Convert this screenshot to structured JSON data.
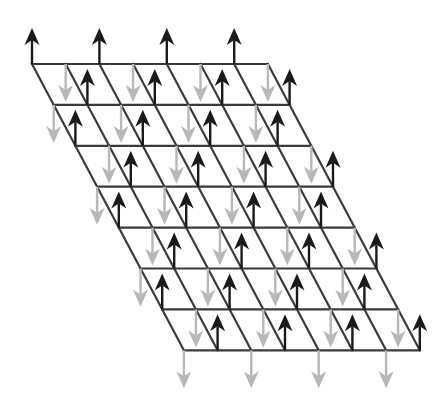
{
  "diagram": {
    "title": "",
    "lattice": {
      "rows": 7,
      "cols": 7,
      "origin": [
        32,
        64
      ],
      "col_step": [
        33.7,
        0
      ],
      "row_step": [
        21.7,
        40.9
      ],
      "line_color": "#3a3a3a"
    },
    "spins": {
      "rule": "node (c, k) with (c + k) even -> up arrow; odd -> down arrow",
      "up": {
        "color": "#1a1a1a",
        "label": "spin-up",
        "length": 36
      },
      "down": {
        "color": "#b8b8b8",
        "label": "spin-down",
        "length": 38
      }
    }
  }
}
